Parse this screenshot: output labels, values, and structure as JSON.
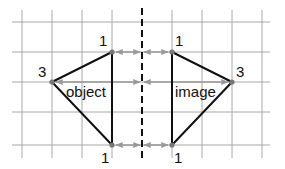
{
  "diagram": {
    "type": "reflection",
    "grid": {
      "color": "#a8a8a8",
      "x_lines": [
        22,
        52,
        82,
        112,
        172,
        202,
        232,
        262
      ],
      "y_lines": [
        22,
        52,
        82,
        112,
        145
      ],
      "x_range": [
        12,
        270
      ],
      "y_range": [
        10,
        158
      ]
    },
    "mirror": {
      "x": 142,
      "y1": 8,
      "y2": 162,
      "color": "#111111"
    },
    "object": {
      "label": "object",
      "vertices": [
        {
          "id": "A",
          "label": "3",
          "x": 52,
          "y": 82
        },
        {
          "id": "B",
          "label": "1",
          "x": 112,
          "y": 52
        },
        {
          "id": "C",
          "label": "1",
          "x": 112,
          "y": 145
        }
      ]
    },
    "image": {
      "label": "image",
      "vertices": [
        {
          "id": "A'",
          "label": "3",
          "x": 232,
          "y": 82
        },
        {
          "id": "B'",
          "label": "1",
          "x": 172,
          "y": 52
        },
        {
          "id": "C'",
          "label": "1",
          "x": 172,
          "y": 145
        }
      ]
    },
    "arrow_color": "#9a9a9a",
    "vertex_color": "#777777",
    "line_color": "#111111"
  }
}
